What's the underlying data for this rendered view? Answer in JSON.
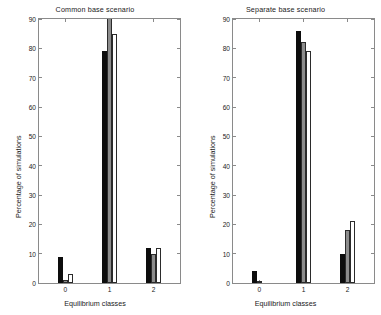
{
  "figure": {
    "background": "#ffffff",
    "axis_color": "#8a8a8a",
    "text_color": "#1a1a1a"
  },
  "chart_data": [
    {
      "type": "bar",
      "title": "Common base scenario",
      "xlabel": "Equilibrium classes",
      "ylabel": "Percentage of simulations",
      "categories": [
        "0",
        "1",
        "2"
      ],
      "xlim": [
        -0.6,
        2.6
      ],
      "ylim": [
        0,
        90
      ],
      "yticks": [
        0,
        10,
        20,
        30,
        40,
        50,
        60,
        70,
        80,
        90
      ],
      "xticks": [
        "0",
        "1",
        "2"
      ],
      "grid": false,
      "legend": "none",
      "series": [
        {
          "name": "series-1",
          "color": "#0d0d0d",
          "values": [
            9,
            79,
            12
          ]
        },
        {
          "name": "series-2",
          "color": "#8c8c8c",
          "values": [
            1,
            92,
            10
          ]
        },
        {
          "name": "series-3",
          "color": "#ffffff",
          "values": [
            3,
            85,
            12
          ]
        }
      ],
      "notes": "Gray bar at class 1 is clipped at the top of the axis (exceeds 90)."
    },
    {
      "type": "bar",
      "title": "Separate base scenario",
      "xlabel": "Equilibrium classes",
      "ylabel": "Percentage of simulations",
      "categories": [
        "0",
        "1",
        "2"
      ],
      "xlim": [
        -0.6,
        2.6
      ],
      "ylim": [
        0,
        90
      ],
      "yticks": [
        0,
        10,
        20,
        30,
        40,
        50,
        60,
        70,
        80,
        90
      ],
      "xticks": [
        "0",
        "1",
        "2"
      ],
      "grid": false,
      "legend": "none",
      "series": [
        {
          "name": "series-1",
          "color": "#0d0d0d",
          "values": [
            4,
            86,
            10
          ]
        },
        {
          "name": "series-2",
          "color": "#8c8c8c",
          "values": [
            0.5,
            82,
            18
          ]
        },
        {
          "name": "series-3",
          "color": "#ffffff",
          "values": [
            0,
            79,
            21
          ]
        }
      ],
      "notes": "White series has no visible bar at class 0."
    }
  ]
}
